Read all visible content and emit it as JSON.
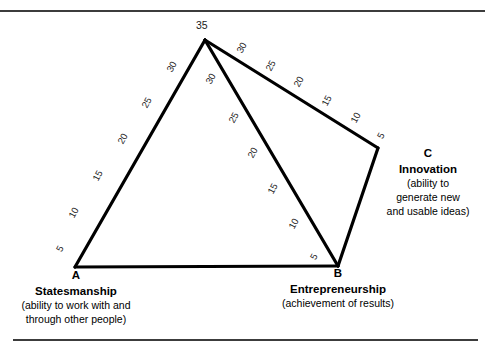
{
  "figure": {
    "line_color": "#000000",
    "rule_color": "#3c3c3c"
  },
  "chart_data": {
    "type": "line",
    "title": "",
    "xlabel": "",
    "ylabel": "",
    "apex_label": "35",
    "vertices": [
      {
        "key": "A",
        "letter": "A",
        "title": "Statesmanship",
        "subtitle_lines": [
          "(ability to work with and",
          "through other people)"
        ],
        "x": 75,
        "y": 267
      },
      {
        "key": "B",
        "letter": "B",
        "title": "Entrepreneurship",
        "subtitle_lines": [
          "(achievement of results)"
        ],
        "x": 338,
        "y": 266
      },
      {
        "key": "C",
        "letter": "C",
        "title": "Innovation",
        "subtitle_lines": [
          "(ability to",
          "generate new",
          "and usable ideas)"
        ],
        "x": 378,
        "y": 148
      }
    ],
    "apex": {
      "x": 205,
      "y": 40
    },
    "axes": [
      {
        "name": "A-to-apex",
        "from": "A",
        "to": "apex",
        "ticks": [
          "5",
          "10",
          "15",
          "20",
          "25",
          "30"
        ],
        "top_value": "35"
      },
      {
        "name": "apex-to-B",
        "from": "apex",
        "to": "B",
        "ticks": [
          "30",
          "25",
          "20",
          "15",
          "10",
          "5"
        ],
        "top_value": "35"
      },
      {
        "name": "apex-to-C",
        "from": "apex",
        "to": "C",
        "ticks": [
          "30",
          "25",
          "20",
          "15",
          "10",
          "5"
        ],
        "top_value": "35"
      },
      {
        "name": "C-to-B",
        "from": "C",
        "to": "B",
        "ticks": []
      },
      {
        "name": "A-to-B",
        "from": "A",
        "to": "B",
        "ticks": []
      }
    ],
    "tick_labels": [
      {
        "id": "left-5",
        "text": "5",
        "x": 57,
        "y": 243,
        "rot": -62
      },
      {
        "id": "left-10",
        "text": "10",
        "x": 68,
        "y": 207,
        "rot": -62
      },
      {
        "id": "left-15",
        "text": "15",
        "x": 92,
        "y": 170,
        "rot": -62
      },
      {
        "id": "left-20",
        "text": "20",
        "x": 117,
        "y": 133,
        "rot": -62
      },
      {
        "id": "left-25",
        "text": "25",
        "x": 141,
        "y": 97,
        "rot": -62
      },
      {
        "id": "left-30",
        "text": "30",
        "x": 166,
        "y": 61,
        "rot": -62
      },
      {
        "id": "mid-30",
        "text": "30",
        "x": 205,
        "y": 73,
        "rot": -62
      },
      {
        "id": "mid-25",
        "text": "25",
        "x": 228,
        "y": 112,
        "rot": -62
      },
      {
        "id": "mid-20",
        "text": "20",
        "x": 247,
        "y": 147,
        "rot": -62
      },
      {
        "id": "mid-15",
        "text": "15",
        "x": 267,
        "y": 183,
        "rot": -62
      },
      {
        "id": "mid-10",
        "text": "10",
        "x": 288,
        "y": 218,
        "rot": -62
      },
      {
        "id": "mid-5",
        "text": "5",
        "x": 311,
        "y": 251,
        "rot": -62
      },
      {
        "id": "right-30",
        "text": "30",
        "x": 236,
        "y": 42,
        "rot": -62
      },
      {
        "id": "right-25",
        "text": "25",
        "x": 265,
        "y": 60,
        "rot": -62
      },
      {
        "id": "right-20",
        "text": "20",
        "x": 293,
        "y": 76,
        "rot": -62
      },
      {
        "id": "right-15",
        "text": "15",
        "x": 321,
        "y": 95,
        "rot": -62
      },
      {
        "id": "right-10",
        "text": "10",
        "x": 350,
        "y": 112,
        "rot": -62
      },
      {
        "id": "right-5",
        "text": "5",
        "x": 378,
        "y": 130,
        "rot": -62
      }
    ],
    "apex_label_pos": {
      "x": 196,
      "y": 19
    }
  }
}
